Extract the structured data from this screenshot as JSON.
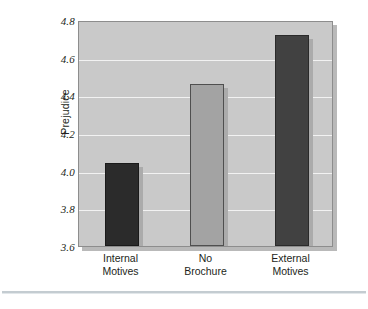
{
  "chart_data": {
    "type": "bar",
    "title": "",
    "xlabel": "",
    "ylabel": "Prejudice",
    "categories": [
      "Internal\nMotives",
      "No\nBrochure",
      "External\nMotives"
    ],
    "category_lines": [
      [
        "Internal",
        "Motives"
      ],
      [
        "No",
        "Brochure"
      ],
      [
        "External",
        "Motives"
      ]
    ],
    "values": [
      4.04,
      4.46,
      4.72
    ],
    "ylim": [
      3.6,
      4.8
    ],
    "ytick_labels": [
      "4.8",
      "4.6",
      "4.4",
      "4.2",
      "4.0",
      "3.8",
      "3.6"
    ],
    "ytick_values": [
      4.8,
      4.6,
      4.4,
      4.2,
      4.0,
      3.8,
      3.6
    ],
    "grid": "horizontal",
    "legend": "none",
    "bar_colors": [
      "#2b2b2b",
      "#a3a3a3",
      "#414141"
    ],
    "bar_edge_colors": [
      "#1a1a1a",
      "#4f4f4f",
      "#2a2a2a"
    ],
    "plot_background": "#c9c9c9",
    "gridline_color": "#f2f2f2",
    "axis_color": "#8d8d8d"
  }
}
